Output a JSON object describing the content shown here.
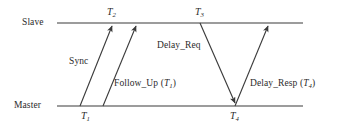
{
  "diagram": {
    "type": "timing-sequence",
    "colors": {
      "line": "#3a3a3a",
      "text": "#2b2b2b",
      "background": "#ffffff"
    },
    "timelines": [
      {
        "id": "slave",
        "label": "Slave",
        "y": 23,
        "x_start": 57,
        "x_end": 303
      },
      {
        "id": "master",
        "label": "Master",
        "y": 106,
        "x_start": 57,
        "x_end": 303
      }
    ],
    "timestamps": [
      {
        "id": "t1",
        "base": "T",
        "sub": "1",
        "x": 86,
        "y": 112,
        "on": "master"
      },
      {
        "id": "t2",
        "base": "T",
        "sub": "2",
        "x": 113,
        "y": 7,
        "on": "slave"
      },
      {
        "id": "t3",
        "base": "T",
        "sub": "3",
        "x": 201,
        "y": 7,
        "on": "slave"
      },
      {
        "id": "t4",
        "base": "T",
        "sub": "4",
        "x": 235,
        "y": 112,
        "on": "master"
      }
    ],
    "messages": [
      {
        "id": "sync",
        "label": "Sync",
        "label_x": 69,
        "label_y": 57,
        "from": {
          "x": 80,
          "y": 106
        },
        "to": {
          "x": 112,
          "y": 24
        },
        "direction": "master-to-slave"
      },
      {
        "id": "follow_up",
        "label": "Follow_Up (",
        "label_var": "T",
        "label_var_sub": "1",
        "label_tail": ")",
        "label_x": 114,
        "label_y": 79,
        "from": {
          "x": 103,
          "y": 106
        },
        "to": {
          "x": 136,
          "y": 24
        },
        "direction": "master-to-slave"
      },
      {
        "id": "delay_req",
        "label": "Delay_Req",
        "label_x": 157,
        "label_y": 41,
        "from": {
          "x": 200,
          "y": 24
        },
        "to": {
          "x": 235,
          "y": 105
        },
        "direction": "slave-to-master"
      },
      {
        "id": "delay_resp",
        "label": "Delay_Resp (",
        "label_var": "T",
        "label_var_sub": "4",
        "label_tail": ")",
        "label_x": 250,
        "label_y": 79,
        "from": {
          "x": 235,
          "y": 106
        },
        "to": {
          "x": 268,
          "y": 24
        },
        "direction": "master-to-slave"
      }
    ]
  }
}
